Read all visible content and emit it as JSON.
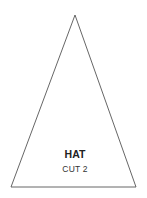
{
  "pattern_piece": {
    "shape": "triangle",
    "points": {
      "apex": [
        75,
        15
      ],
      "base_left": [
        11,
        187
      ],
      "base_right": [
        136,
        187
      ]
    },
    "stroke_color": "#555555",
    "fill_color": "#ffffff",
    "label": "HAT",
    "instruction": "CUT 2"
  }
}
